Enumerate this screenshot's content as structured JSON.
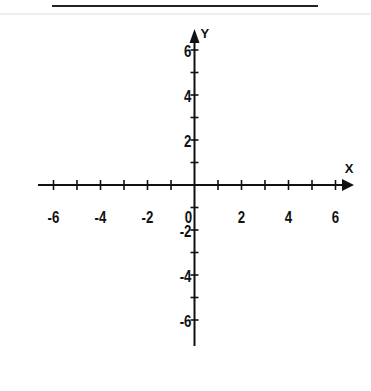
{
  "header": {
    "top_rule": {
      "x1": 52,
      "x2": 318,
      "y": 6,
      "color": "#222222"
    },
    "faint_rule": {
      "x1": 0,
      "x2": 371,
      "y": 14,
      "color": "#dddddd"
    }
  },
  "axes": {
    "color": "#111111",
    "origin": {
      "x": 194.5,
      "y": 185
    },
    "x_axis": {
      "label": "X",
      "start_x": 38,
      "end_x": 354,
      "tick_spacing": 23.5,
      "min": -6,
      "max": 6,
      "labeled_ticks": [
        {
          "value": -6,
          "text": "-6"
        },
        {
          "value": -4,
          "text": "-4"
        },
        {
          "value": -2,
          "text": "-2"
        },
        {
          "value": 0,
          "text": "0"
        },
        {
          "value": 2,
          "text": "2"
        },
        {
          "value": 4,
          "text": "4"
        },
        {
          "value": 6,
          "text": "6"
        }
      ]
    },
    "y_axis": {
      "label": "Y",
      "start_y": 346,
      "end_y": 29,
      "tick_spacing": 22.5,
      "min": -7,
      "max": 6,
      "labeled_ticks": [
        {
          "value": 6,
          "text": "6"
        },
        {
          "value": 4,
          "text": "4"
        },
        {
          "value": 2,
          "text": "2"
        },
        {
          "value": -2,
          "text": "-2"
        },
        {
          "value": -4,
          "text": "-4"
        },
        {
          "value": -6,
          "text": "-6"
        }
      ]
    }
  }
}
